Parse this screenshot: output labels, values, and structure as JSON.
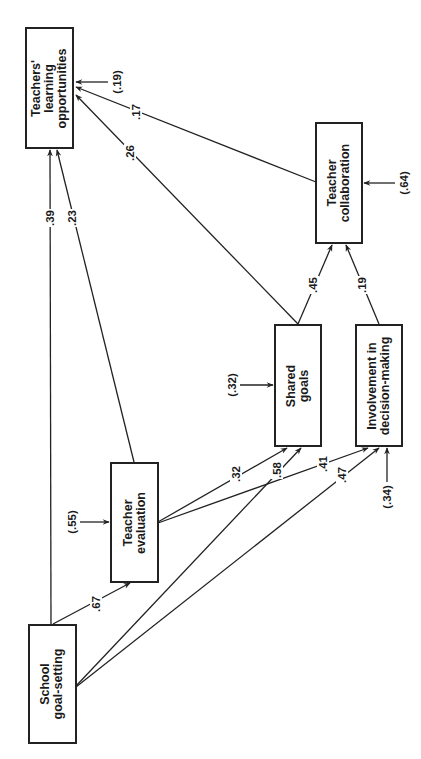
{
  "nodes": {
    "learning": {
      "line1": "Teachers'",
      "line2": "learning",
      "line3": "opportunities"
    },
    "collaboration": {
      "line1": "Teacher",
      "line2": "collaboration"
    },
    "shared_goals": {
      "line1": "Shared",
      "line2": "goals"
    },
    "involvement": {
      "line1": "Involvement in",
      "line2": "decision-making"
    },
    "evaluation": {
      "line1": "Teacher",
      "line2": "evaluation"
    },
    "goal_setting": {
      "line1": "School",
      "line2": "goal-setting"
    }
  },
  "residuals": {
    "learning": "(.19)",
    "collaboration": "(.64)",
    "shared_goals": "(.32)",
    "involvement": "(.34)",
    "evaluation": "(.55)"
  },
  "paths": [
    {
      "from": "School goal-setting",
      "to": "Teachers' learning opportunities",
      "coef": ".39"
    },
    {
      "from": "Teacher evaluation",
      "to": "Teachers' learning opportunities",
      "coef": ".23"
    },
    {
      "from": "Shared goals",
      "to": "Teachers' learning opportunities",
      "coef": ".26"
    },
    {
      "from": "Teacher collaboration",
      "to": "Teachers' learning opportunities",
      "coef": ".17"
    },
    {
      "from": "Shared goals",
      "to": "Teacher collaboration",
      "coef": ".45"
    },
    {
      "from": "Involvement in decision-making",
      "to": "Teacher collaboration",
      "coef": ".19"
    },
    {
      "from": "School goal-setting",
      "to": "Teacher evaluation",
      "coef": ".67"
    },
    {
      "from": "Teacher evaluation",
      "to": "Shared goals",
      "coef": ".32"
    },
    {
      "from": "School goal-setting",
      "to": "Shared goals",
      "coef": ".58"
    },
    {
      "from": "Teacher evaluation",
      "to": "Involvement in decision-making",
      "coef": ".41"
    },
    {
      "from": "School goal-setting",
      "to": "Involvement in decision-making",
      "coef": ".47"
    }
  ],
  "labels": {
    "p39": ".39",
    "p23": ".23",
    "p26": ".26",
    "p17": ".17",
    "p45": ".45",
    "p19": ".19",
    "p67": ".67",
    "p32": ".32",
    "p58": ".58",
    "p41": ".41",
    "p47": ".47"
  }
}
